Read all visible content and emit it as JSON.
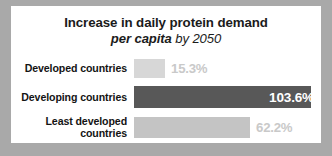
{
  "card": {
    "background": "#ffffff",
    "page_background": "#a9a9a9"
  },
  "title": {
    "line1": "Increase in daily protein demand",
    "emphasis": "per capita",
    "line2_tail": " by 2050"
  },
  "chart_data": {
    "type": "bar",
    "orientation": "horizontal",
    "title": "Increase in daily protein demand per capita by 2050",
    "xlabel": "",
    "ylabel": "",
    "xlim": [
      0,
      110
    ],
    "grid": false,
    "legend": "none",
    "value_suffix": "%",
    "categories": [
      "Developed countries",
      "Developing countries",
      "Least developed countries"
    ],
    "values": [
      15.3,
      103.6,
      62.2
    ],
    "value_labels": [
      "15.3%",
      "103.6%",
      "62.2%"
    ],
    "bar_colors": [
      "#d7d7d7",
      "#585858",
      "#c4c4c4"
    ],
    "label_colors": [
      "#c9c9c9",
      "#ffffff",
      "#c9c9c9"
    ],
    "label_placement": [
      "outside",
      "inside",
      "outside"
    ]
  },
  "rows": [
    {
      "label_line1": "Developed countries",
      "label_line2": "",
      "value": "15.3%",
      "bar_width_px": 31
    },
    {
      "label_line1": "Developing countries",
      "label_line2": "",
      "value": "103.6%",
      "bar_width_px": 177
    },
    {
      "label_line1": "Least developed",
      "label_line2": "countries",
      "value": "62.2%",
      "bar_width_px": 116
    }
  ]
}
